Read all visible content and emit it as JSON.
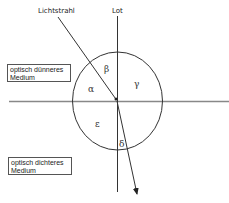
{
  "diagram": {
    "labels": {
      "ray": "Lichtstrahl",
      "normal": "Lot",
      "medium_top": [
        "optisch dünneres",
        "Medium"
      ],
      "medium_bottom": [
        "optisch dichteres",
        "Medium"
      ]
    },
    "angles": {
      "alpha": "α",
      "beta": "β",
      "gamma": "γ",
      "epsilon": "ε",
      "delta": "δ"
    },
    "colors": {
      "line": "#333333",
      "interface": "#888888",
      "background": "#ffffff"
    }
  }
}
